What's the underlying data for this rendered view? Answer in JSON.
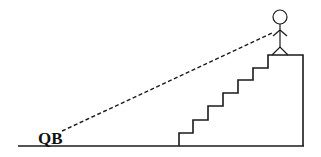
{
  "diagram": {
    "label": "QB",
    "colors": {
      "stroke": "#1a1a1a",
      "background": "#ffffff"
    },
    "elements": [
      "ground-line",
      "staircase",
      "platform",
      "stick-figure",
      "line-of-sight-dashed"
    ]
  }
}
